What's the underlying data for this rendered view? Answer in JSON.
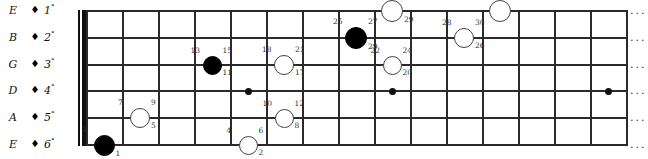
{
  "diagram": {
    "type": "guitar-fretboard",
    "continuation_glyph": "...",
    "strings": [
      {
        "note": "E",
        "degree": "1",
        "degree_sup": "°",
        "diamond": "♦"
      },
      {
        "note": "B",
        "degree": "2",
        "degree_sup": "°",
        "diamond": "♦"
      },
      {
        "note": "G",
        "degree": "3",
        "degree_sup": "°",
        "diamond": "♦"
      },
      {
        "note": "D",
        "degree": "4",
        "degree_sup": "°",
        "diamond": "♦"
      },
      {
        "note": "A",
        "degree": "5",
        "degree_sup": "°",
        "diamond": "♦"
      },
      {
        "note": "E",
        "degree": "6",
        "degree_sup": "°",
        "diamond": "♦"
      }
    ],
    "fret_count": 15,
    "inlay_frets": [
      5,
      9,
      15
    ],
    "markers": [
      {
        "id": "m1",
        "style": "filled",
        "string": 6,
        "fret": 1,
        "size": 21,
        "labels": {
          "tl": "3",
          "tr": "",
          "br": "1"
        }
      },
      {
        "id": "m2",
        "style": "open",
        "string": 5,
        "fret": 2,
        "size": 20,
        "labels": {
          "tl": "7",
          "tr": "9",
          "br": "5"
        }
      },
      {
        "id": "m3",
        "style": "filled",
        "string": 3,
        "fret": 4,
        "size": 19,
        "labels": {
          "tl": "13",
          "tr": "15",
          "br": "11"
        }
      },
      {
        "id": "m4",
        "style": "open",
        "string": 6,
        "fret": 5,
        "size": 19,
        "labels": {
          "tl": "4",
          "tr": "6",
          "br": "2"
        }
      },
      {
        "id": "m5",
        "style": "open",
        "string": 3,
        "fret": 6,
        "size": 20,
        "labels": {
          "tl": "18",
          "tr": "21",
          "br": "17"
        }
      },
      {
        "id": "m6",
        "style": "open",
        "string": 5,
        "fret": 6,
        "size": 19,
        "labels": {
          "tl": "10",
          "tr": "12",
          "br": "8"
        }
      },
      {
        "id": "m7",
        "style": "filled",
        "string": 2,
        "fret": 8,
        "size": 22,
        "labels": {
          "tl": "25",
          "tr": "27",
          "br": "29"
        }
      },
      {
        "id": "m8",
        "style": "open",
        "string": 3,
        "fret": 9,
        "size": 19,
        "labels": {
          "tl": "22",
          "tr": "24",
          "br": "20"
        }
      },
      {
        "id": "m9",
        "style": "open",
        "string": 1,
        "fret": 9,
        "size": 22,
        "labels": {
          "tl": "",
          "tr": "31",
          "br": "29"
        }
      },
      {
        "id": "m10",
        "style": "open",
        "string": 2,
        "fret": 11,
        "size": 20,
        "labels": {
          "tl": "28",
          "tr": "30",
          "br": "26"
        }
      },
      {
        "id": "m11",
        "style": "open",
        "string": 1,
        "fret": 12,
        "size": 22,
        "labels": {
          "tl": "",
          "tr": "32",
          "br": ""
        }
      }
    ]
  }
}
